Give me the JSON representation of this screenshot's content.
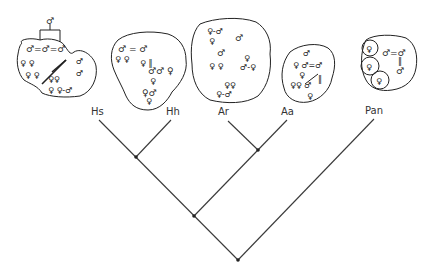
{
  "diagram": {
    "type": "cladogram",
    "colors": {
      "line": "#3a3a3a",
      "node": "#222222",
      "text": "#333333",
      "background": "#ffffff"
    },
    "taxa": [
      {
        "id": "hs",
        "label": "Hs",
        "label_pos": [
          91,
          107
        ]
      },
      {
        "id": "hh",
        "label": "Hh",
        "label_pos": [
          166,
          107
        ]
      },
      {
        "id": "ar",
        "label": "Ar",
        "label_pos": [
          218,
          107
        ]
      },
      {
        "id": "aa",
        "label": "Aa",
        "label_pos": [
          281,
          107
        ]
      },
      {
        "id": "pan",
        "label": "Pan",
        "label_pos": [
          365,
          106
        ]
      }
    ],
    "nodes": [
      {
        "id": "hs_hh",
        "pos": [
          136,
          157
        ]
      },
      {
        "id": "ar_aa",
        "pos": [
          258,
          150
        ]
      },
      {
        "id": "homo_aust",
        "pos": [
          194,
          216
        ]
      },
      {
        "id": "root",
        "pos": [
          238,
          260
        ]
      }
    ],
    "social_groups": [
      {
        "taxon": "Hs",
        "description": "multi-level society: male-bonded groups with pair bonds, fission-fusion communities"
      },
      {
        "taxon": "Hh",
        "description": "community of male-female pairs and bonded males"
      },
      {
        "taxon": "Ar",
        "description": "community with pair-bonded units"
      },
      {
        "taxon": "Aa",
        "description": "community with bonded males and dispersed females"
      },
      {
        "taxon": "Pan",
        "description": "male-bonded community with females and offspring ranging separately"
      }
    ],
    "symbols": {
      "male": "♂",
      "female": "♀",
      "bond": "="
    }
  }
}
